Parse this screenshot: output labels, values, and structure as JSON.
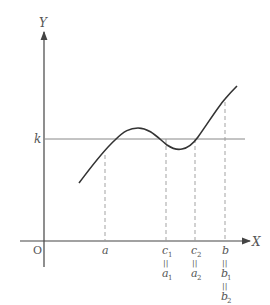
{
  "axes": {
    "y_label": "Y",
    "x_label": "X",
    "origin_label": "O",
    "k_label": "k"
  },
  "ticks": [
    {
      "main": "a",
      "sub": "",
      "eq": []
    },
    {
      "main": "c",
      "sub": "1",
      "eq": [
        {
          "main": "a",
          "sub": "1"
        }
      ]
    },
    {
      "main": "c",
      "sub": "2",
      "eq": [
        {
          "main": "a",
          "sub": "2"
        }
      ]
    },
    {
      "main": "b",
      "sub": "",
      "eq": [
        {
          "main": "b",
          "sub": "1"
        },
        {
          "main": "b",
          "sub": "2"
        }
      ]
    }
  ],
  "equals_glyph": "||",
  "colors": {
    "axis": "#444444",
    "curve": "#333333",
    "k_line": "#888888",
    "dashed": "#999999",
    "text": "#555555"
  }
}
